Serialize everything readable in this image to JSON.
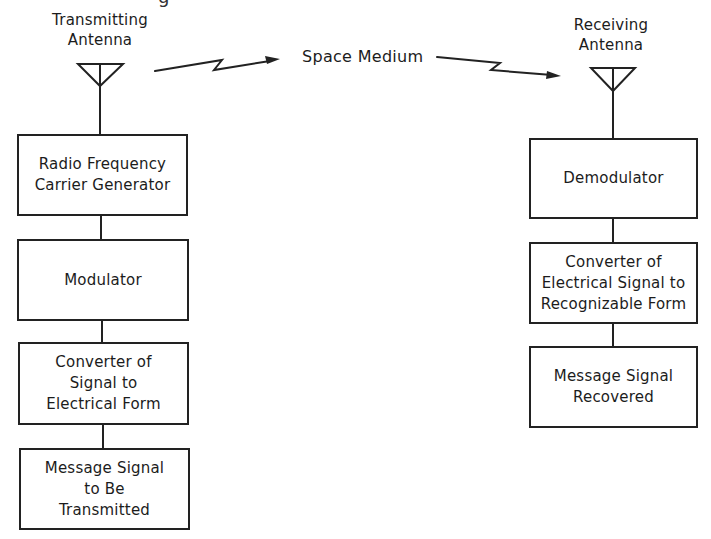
{
  "diagram": {
    "type": "block-diagram",
    "top_fragment": "g",
    "transmitter": {
      "antenna_label": [
        "Transmitting",
        "Antenna"
      ],
      "antenna_icon": "antenna-icon",
      "blocks": [
        {
          "id": "rf-carrier-generator",
          "lines": [
            "Radio Frequency",
            "Carrier Generator"
          ]
        },
        {
          "id": "modulator",
          "lines": [
            "Modulator"
          ]
        },
        {
          "id": "signal-to-electrical-converter",
          "lines": [
            "Converter of",
            "Signal to",
            "Electrical Form"
          ]
        },
        {
          "id": "message-signal-source",
          "lines": [
            "Message Signal",
            "to Be",
            "Transmitted"
          ]
        }
      ]
    },
    "medium": {
      "label": "Space Medium",
      "arrows": [
        "lightning-arrow-icon",
        "lightning-arrow-icon"
      ]
    },
    "receiver": {
      "antenna_label": [
        "Receiving",
        "Antenna"
      ],
      "antenna_icon": "antenna-icon",
      "blocks": [
        {
          "id": "demodulator",
          "lines": [
            "Demodulator"
          ]
        },
        {
          "id": "electrical-to-recognizable-converter",
          "lines": [
            "Converter of",
            "Electrical Signal to",
            "Recognizable Form"
          ]
        },
        {
          "id": "message-signal-recovered",
          "lines": [
            "Message Signal",
            "Recovered"
          ]
        }
      ]
    },
    "colors": {
      "line": "#222222",
      "text": "#1c1c1c",
      "background": "#ffffff"
    }
  }
}
